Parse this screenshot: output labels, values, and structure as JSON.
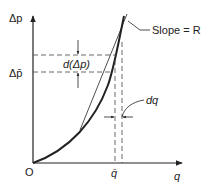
{
  "diagram": {
    "type": "pressure-drop vs flow curve",
    "y_axis_label": "Δp",
    "x_axis_label": "q",
    "origin_label": "O",
    "mean_pressure_label": "Δp̄",
    "mean_flow_label": "q̄",
    "pressure_increment_label": "d(Δp)",
    "flow_increment_label": "dq",
    "tangent_label": "Slope = R"
  },
  "colors": {
    "ink": "#222222",
    "background": "#ffffff"
  }
}
